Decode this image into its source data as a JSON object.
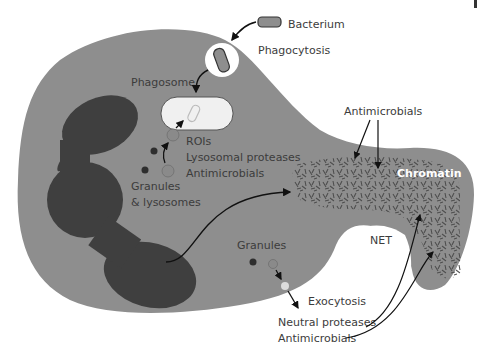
{
  "diagram": {
    "colors": {
      "cell": "#8e8e8e",
      "nucleus": "#3f3f3f",
      "chromatin_fibers": "#4a4a4a",
      "phagosome_fill": "#f0f0f0",
      "granule_dark": "#2e2e2e",
      "granule_mid": "#8a8a8a",
      "granule_light": "#dcdcdc",
      "arrow": "#111111",
      "text": "#3c3c3c"
    },
    "labels": {
      "bacterium": "Bacterium",
      "phagocytosis": "Phagocytosis",
      "phagosome": "Phagosome",
      "rois": "ROIs",
      "lysosomal_proteases": "Lysosomal proteases",
      "antimicrobials_1": "Antimicrobials",
      "granules_lysosomes_1": "Granules",
      "granules_lysosomes_2": "& lysosomes",
      "antimicrobials_net": "Antimicrobials",
      "chromatin": "Chromatin",
      "net": "NET",
      "granules": "Granules",
      "exocytosis": "Exocytosis",
      "neutral_proteases": "Neutral proteases",
      "antimicrobials_2": "Antimicrobials"
    }
  }
}
